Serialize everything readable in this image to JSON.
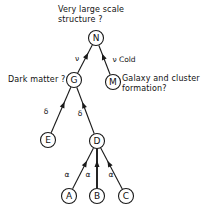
{
  "figure": {
    "title_annotation": "Very large scale\nstructure ?",
    "left_annotation": "Dark matter ?",
    "right_annotation": "Galaxy and cluster\nformation?",
    "stroke_color": "#1a1a1a",
    "background_color": "#ffffff"
  },
  "nodes": [
    {
      "id": "N",
      "label": "N",
      "x": 96,
      "y": 38,
      "r": 7.5
    },
    {
      "id": "G",
      "label": "G",
      "x": 74,
      "y": 80,
      "r": 7.5
    },
    {
      "id": "M",
      "label": "M",
      "x": 113,
      "y": 82,
      "r": 7.5
    },
    {
      "id": "E",
      "label": "E",
      "x": 48,
      "y": 140,
      "r": 7.5
    },
    {
      "id": "D",
      "label": "D",
      "x": 97,
      "y": 141,
      "r": 7.5
    },
    {
      "id": "A",
      "label": "A",
      "x": 69,
      "y": 196,
      "r": 7.5
    },
    {
      "id": "B",
      "label": "B",
      "x": 97,
      "y": 196,
      "r": 7.5
    },
    {
      "id": "C",
      "label": "C",
      "x": 126,
      "y": 196,
      "r": 7.5
    }
  ],
  "edges": [
    {
      "id": "G-N",
      "from": "G",
      "to": "N",
      "label": "ν",
      "label_x": 77,
      "label_y": 58,
      "thick": false
    },
    {
      "id": "M-N",
      "from": "M",
      "to": "N",
      "label": "ν Cold",
      "label_x": 124,
      "label_y": 59,
      "thick": false
    },
    {
      "id": "E-G",
      "from": "E",
      "to": "G",
      "label": "δ",
      "label_x": 46,
      "label_y": 111,
      "thick": false
    },
    {
      "id": "D-G",
      "from": "D",
      "to": "G",
      "label": "δ",
      "label_x": 80,
      "label_y": 113,
      "thick": false
    },
    {
      "id": "A-D",
      "from": "A",
      "to": "D",
      "label": "α",
      "label_x": 67,
      "label_y": 174,
      "thick": false
    },
    {
      "id": "B-D",
      "from": "B",
      "to": "D",
      "label": "α",
      "label_x": 88,
      "label_y": 174,
      "thick": true
    },
    {
      "id": "C-D",
      "from": "C",
      "to": "D",
      "label": "α",
      "label_x": 111,
      "label_y": 174,
      "thick": false
    }
  ]
}
